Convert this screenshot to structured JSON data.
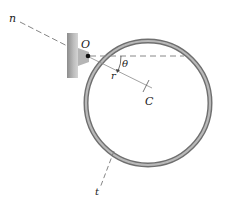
{
  "diagram": {
    "type": "rigid-body-pendulum-ring",
    "labels": {
      "pivot": "O",
      "center": "C",
      "radius": "r",
      "angle": "θ",
      "normal_axis": "n",
      "tangent_axis": "t"
    },
    "colors": {
      "ring_outer": "#7a7a7a",
      "ring_inner": "#b8b8b8",
      "support": "#a0a0a0",
      "dashed_line": "#888888",
      "label": "#222222"
    },
    "geometry": {
      "ring_center": [
        148,
        103
      ],
      "ring_radius": 62,
      "pivot": [
        87,
        56
      ]
    }
  }
}
